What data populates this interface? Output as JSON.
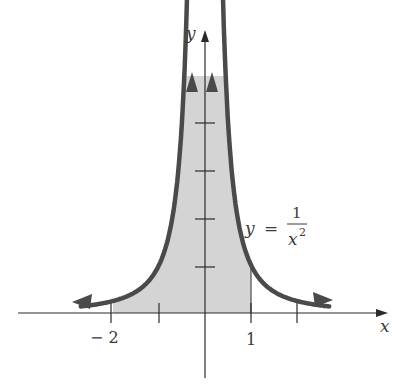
{
  "figure": {
    "axis_labels": {
      "x": "x",
      "y": "y"
    },
    "tick_labels": {
      "neg_two": "− 2",
      "one": "1"
    },
    "equation": {
      "lhs": "y",
      "eq": "=",
      "numerator": "1",
      "denominator_base": "x",
      "denominator_exp": "2"
    },
    "colors": {
      "curve": "#4a4a4a",
      "shade": "#d4d4d4",
      "axis": "#2a2a2a"
    }
  },
  "chart_data": {
    "type": "area",
    "title": "",
    "function": "y = 1/x^2",
    "xlabel": "x",
    "ylabel": "y",
    "x_ticks": [
      -3,
      -2,
      -1,
      0,
      1,
      2
    ],
    "x_tick_labels": {
      "-2": "−2",
      "1": "1"
    },
    "y_ticks": [
      1,
      2,
      3,
      4
    ],
    "shaded_region": {
      "x_from": -2,
      "x_to": 1,
      "between": "curve and x-axis"
    },
    "asymptotes": {
      "vertical": 0,
      "horizontal": 0
    },
    "grid": false,
    "legend": null
  }
}
